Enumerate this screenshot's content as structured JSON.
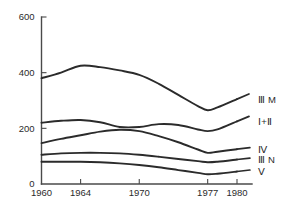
{
  "chart_data": {
    "type": "line",
    "title": "",
    "subtitle": "",
    "xlabel": "",
    "ylabel": "",
    "xlim": [
      1960,
      1980
    ],
    "ylim": [
      0,
      600
    ],
    "grid": false,
    "legend_position": "right-inline-labels",
    "x_ticks": [
      1960,
      1964,
      1970,
      1977,
      1980
    ],
    "x_tick_labels": [
      "1960",
      "1964",
      "1970",
      "1977",
      "1980"
    ],
    "y_ticks": [
      0,
      200,
      400,
      600
    ],
    "y_tick_labels": [
      "0",
      "200",
      "400",
      "600"
    ],
    "line_color": "#2b2b2b",
    "axis_color": "#4a4a4a",
    "background_color": "#ffffff",
    "x": [
      1960,
      1962,
      1964,
      1966,
      1968,
      1970,
      1972,
      1974,
      1976,
      1977,
      1978,
      1980
    ],
    "series": [
      {
        "name": "III M",
        "label": "Ⅲ M",
        "values": [
          380,
          400,
          425,
          420,
          408,
          392,
          360,
          320,
          280,
          265,
          275,
          305
        ]
      },
      {
        "name": "I+II",
        "label": "Ⅰ+Ⅱ",
        "values": [
          220,
          227,
          230,
          222,
          205,
          205,
          215,
          212,
          196,
          190,
          196,
          225
        ]
      },
      {
        "name": "IV",
        "label": "Ⅳ",
        "values": [
          147,
          162,
          175,
          188,
          195,
          190,
          172,
          150,
          124,
          112,
          116,
          125
        ]
      },
      {
        "name": "III N",
        "label": "Ⅲ N",
        "values": [
          105,
          110,
          112,
          112,
          110,
          105,
          98,
          90,
          82,
          78,
          80,
          88
        ]
      },
      {
        "name": "V",
        "label": "Ⅴ",
        "values": [
          80,
          80,
          80,
          78,
          74,
          68,
          60,
          50,
          40,
          35,
          37,
          45
        ]
      }
    ],
    "series_label_positions": [
      {
        "name": "III M",
        "y_value": 305
      },
      {
        "name": "I+II",
        "y_value": 225
      },
      {
        "name": "IV",
        "y_value": 125
      },
      {
        "name": "III N",
        "y_value": 88
      },
      {
        "name": "V",
        "y_value": 45
      }
    ]
  }
}
